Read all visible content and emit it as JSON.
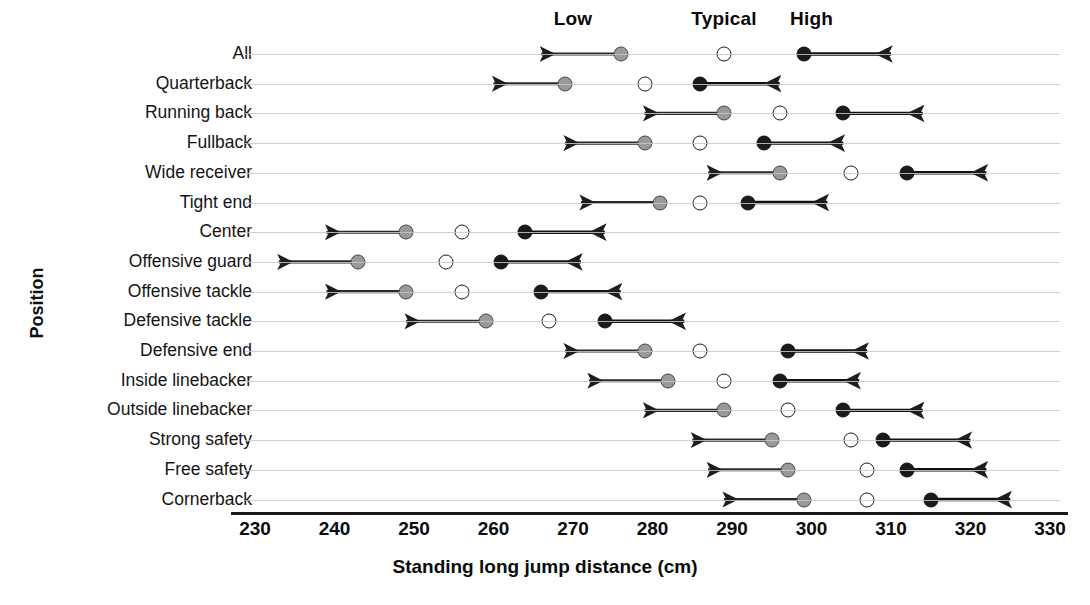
{
  "chart_data": {
    "type": "scatter",
    "title": "",
    "xlabel": "Standing long jump distance (cm)",
    "ylabel": "Position",
    "xlim": [
      230,
      330
    ],
    "xticks": [
      230,
      240,
      250,
      260,
      270,
      280,
      290,
      300,
      310,
      320,
      330
    ],
    "grid": true,
    "legend_position": "top",
    "series_headers": [
      "Low",
      "Typical",
      "High"
    ],
    "header_positions": [
      270,
      289,
      300
    ],
    "categories": [
      "All",
      "Quarterback",
      "Running back",
      "Fullback",
      "Wide receiver",
      "Tight end",
      "Center",
      "Offensive guard",
      "Offensive tackle",
      "Defensive tackle",
      "Defensive end",
      "Inside linebacker",
      "Outside linebacker",
      "Strong safety",
      "Free safety",
      "Cornerback"
    ],
    "series": [
      {
        "name": "Low",
        "marker": "gray-filled-circle",
        "color": "#9a9a9a",
        "values": [
          276,
          269,
          289,
          279,
          296,
          281,
          249,
          243,
          249,
          259,
          279,
          282,
          289,
          295,
          297,
          299
        ]
      },
      {
        "name": "Typical",
        "marker": "open-circle",
        "color": "#ffffff",
        "values": [
          289,
          279,
          296,
          286,
          305,
          286,
          256,
          254,
          256,
          267,
          286,
          289,
          297,
          305,
          307,
          307
        ]
      },
      {
        "name": "High",
        "marker": "black-filled-circle",
        "color": "#1a1a1a",
        "values": [
          299,
          286,
          304,
          294,
          312,
          292,
          264,
          261,
          266,
          274,
          297,
          296,
          304,
          309,
          312,
          315
        ]
      }
    ],
    "arrows": [
      {
        "category": "All",
        "low_arrow_to": 266,
        "high_arrow_to": 310
      },
      {
        "category": "Quarterback",
        "low_arrow_to": 260,
        "high_arrow_to": 296
      },
      {
        "category": "Running back",
        "low_arrow_to": 279,
        "high_arrow_to": 314
      },
      {
        "category": "Fullback",
        "low_arrow_to": 269,
        "high_arrow_to": 304
      },
      {
        "category": "Wide receiver",
        "low_arrow_to": 287,
        "high_arrow_to": 322
      },
      {
        "category": "Tight end",
        "low_arrow_to": 271,
        "high_arrow_to": 302
      },
      {
        "category": "Center",
        "low_arrow_to": 239,
        "high_arrow_to": 274
      },
      {
        "category": "Offensive guard",
        "low_arrow_to": 233,
        "high_arrow_to": 271
      },
      {
        "category": "Offensive tackle",
        "low_arrow_to": 239,
        "high_arrow_to": 276
      },
      {
        "category": "Defensive tackle",
        "low_arrow_to": 249,
        "high_arrow_to": 284
      },
      {
        "category": "Defensive end",
        "low_arrow_to": 269,
        "high_arrow_to": 307
      },
      {
        "category": "Inside linebacker",
        "low_arrow_to": 272,
        "high_arrow_to": 306
      },
      {
        "category": "Outside linebacker",
        "low_arrow_to": 279,
        "high_arrow_to": 314
      },
      {
        "category": "Strong safety",
        "low_arrow_to": 285,
        "high_arrow_to": 320
      },
      {
        "category": "Free safety",
        "low_arrow_to": 287,
        "high_arrow_to": 322
      },
      {
        "category": "Cornerback",
        "low_arrow_to": 289,
        "high_arrow_to": 325
      }
    ]
  }
}
